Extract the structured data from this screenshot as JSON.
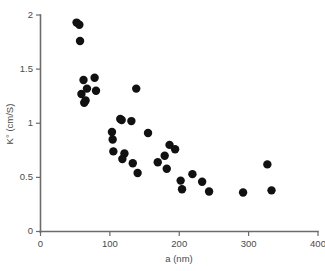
{
  "chart_data": {
    "type": "scatter",
    "title": "",
    "xlabel": "a (nm)",
    "ylabel": "K° (cm/S)",
    "xlim": [
      0,
      400
    ],
    "ylim": [
      0,
      2
    ],
    "xticks": [
      0,
      100,
      200,
      300,
      400
    ],
    "yticks": [
      0,
      0.5,
      1,
      1.5,
      2
    ],
    "xtick_labels": [
      "0",
      "100",
      "200",
      "300",
      "400"
    ],
    "ytick_labels": [
      "0",
      "0.5",
      "1",
      "1.5",
      "2"
    ],
    "grid": false,
    "legend": null,
    "marker": {
      "shape": "circle",
      "color": "#111111",
      "size_px": 5.2
    },
    "series": [
      {
        "name": "K° vs a",
        "points": [
          [
            52,
            1.93
          ],
          [
            56,
            1.91
          ],
          [
            57,
            1.76
          ],
          [
            59,
            1.27
          ],
          [
            62,
            1.4
          ],
          [
            63,
            1.19
          ],
          [
            65,
            1.21
          ],
          [
            67,
            1.32
          ],
          [
            78,
            1.42
          ],
          [
            80,
            1.3
          ],
          [
            103,
            0.92
          ],
          [
            104,
            0.85
          ],
          [
            105,
            0.74
          ],
          [
            115,
            1.04
          ],
          [
            117,
            1.03
          ],
          [
            118,
            0.67
          ],
          [
            121,
            0.72
          ],
          [
            131,
            1.02
          ],
          [
            133,
            0.63
          ],
          [
            138,
            1.32
          ],
          [
            140,
            0.54
          ],
          [
            155,
            0.91
          ],
          [
            169,
            0.64
          ],
          [
            179,
            0.7
          ],
          [
            182,
            0.58
          ],
          [
            186,
            0.8
          ],
          [
            194,
            0.76
          ],
          [
            202,
            0.47
          ],
          [
            204,
            0.39
          ],
          [
            219,
            0.53
          ],
          [
            233,
            0.46
          ],
          [
            243,
            0.37
          ],
          [
            292,
            0.36
          ],
          [
            327,
            0.62
          ],
          [
            333,
            0.38
          ]
        ]
      }
    ]
  },
  "axes": {
    "x_axis_name": "x-axis",
    "y_axis_name": "y-axis"
  }
}
